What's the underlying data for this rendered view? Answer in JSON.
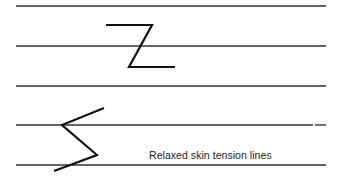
{
  "diagram": {
    "caption": "Relaxed skin tension lines",
    "colors": {
      "background": "#ffffff",
      "lines": "#333333",
      "incisions": "#111111",
      "text": "#222222"
    },
    "skin_tension_lines": [
      {
        "y": 6,
        "x1": 16,
        "x2": 326
      },
      {
        "y": 46,
        "x1": 16,
        "x2": 326
      },
      {
        "y": 86,
        "x1": 16,
        "x2": 326
      },
      {
        "y": 125,
        "x1": 16,
        "x2": 326,
        "gap_at_x": 314
      },
      {
        "y": 165,
        "x1": 16,
        "x2": 326
      }
    ],
    "shapes": [
      {
        "name": "z-plasty-incision",
        "points": [
          [
            106,
            25
          ],
          [
            152,
            25
          ],
          [
            129,
            67
          ],
          [
            175,
            67
          ]
        ]
      },
      {
        "name": "zigzag-incision",
        "points": [
          [
            104,
            108
          ],
          [
            62,
            125
          ],
          [
            97,
            155
          ],
          [
            54,
            171
          ]
        ]
      }
    ]
  }
}
